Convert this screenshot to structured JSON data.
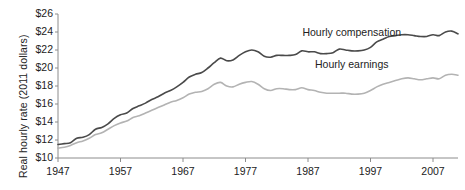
{
  "chart_data": {
    "type": "line",
    "title": "",
    "xlabel": "",
    "ylabel": "Real hourly rate (2011 dollars)",
    "xlim": [
      1947,
      2011
    ],
    "ylim": [
      10,
      26
    ],
    "ytick_prefix": "$",
    "grid": false,
    "legend": "inline-annotations",
    "xticks": [
      1947,
      1957,
      1967,
      1977,
      1987,
      1997,
      2007
    ],
    "xtick_labels": [
      "1947",
      "1957",
      "1967",
      "1977",
      "1987",
      "1997",
      "2007"
    ],
    "yticks": [
      10,
      12,
      14,
      16,
      18,
      20,
      22,
      24,
      26
    ],
    "ytick_labels": [
      "$10",
      "$12",
      "$14",
      "$16",
      "$18",
      "$20",
      "$22",
      "$24",
      "$26"
    ],
    "series": [
      {
        "name": "Hourly compensation",
        "color": "#4a4a4a",
        "label_x": 1994,
        "label_y": 23.9,
        "x": [
          1947,
          1948,
          1949,
          1950,
          1951,
          1952,
          1953,
          1954,
          1955,
          1956,
          1957,
          1958,
          1959,
          1960,
          1961,
          1962,
          1963,
          1964,
          1965,
          1966,
          1967,
          1968,
          1969,
          1970,
          1971,
          1972,
          1973,
          1974,
          1975,
          1976,
          1977,
          1978,
          1979,
          1980,
          1981,
          1982,
          1983,
          1984,
          1985,
          1986,
          1987,
          1988,
          1989,
          1990,
          1991,
          1992,
          1993,
          1994,
          1995,
          1996,
          1997,
          1998,
          1999,
          2000,
          2001,
          2002,
          2003,
          2004,
          2005,
          2006,
          2007,
          2008,
          2009,
          2010,
          2011
        ],
        "values": [
          11.5,
          11.6,
          11.7,
          12.2,
          12.3,
          12.6,
          13.2,
          13.4,
          13.8,
          14.4,
          14.8,
          15.0,
          15.5,
          15.8,
          16.1,
          16.5,
          16.8,
          17.2,
          17.5,
          17.9,
          18.4,
          19.0,
          19.3,
          19.5,
          20.0,
          20.6,
          21.1,
          20.8,
          20.9,
          21.4,
          21.8,
          22.0,
          21.8,
          21.3,
          21.2,
          21.4,
          21.4,
          21.4,
          21.5,
          21.9,
          21.8,
          21.8,
          21.6,
          21.6,
          21.7,
          22.1,
          22.0,
          21.9,
          21.9,
          22.0,
          22.3,
          22.9,
          23.2,
          23.5,
          23.6,
          23.7,
          23.7,
          23.6,
          23.5,
          23.5,
          23.7,
          23.6,
          24.0,
          24.1,
          23.8
        ]
      },
      {
        "name": "Hourly earnings",
        "color": "#b3b3b3",
        "label_x": 1994,
        "label_y": 20.3,
        "x": [
          1947,
          1948,
          1949,
          1950,
          1951,
          1952,
          1953,
          1954,
          1955,
          1956,
          1957,
          1958,
          1959,
          1960,
          1961,
          1962,
          1963,
          1964,
          1965,
          1966,
          1967,
          1968,
          1969,
          1970,
          1971,
          1972,
          1973,
          1974,
          1975,
          1976,
          1977,
          1978,
          1979,
          1980,
          1981,
          1982,
          1983,
          1984,
          1985,
          1986,
          1987,
          1988,
          1989,
          1990,
          1991,
          1992,
          1993,
          1994,
          1995,
          1996,
          1997,
          1998,
          1999,
          2000,
          2001,
          2002,
          2003,
          2004,
          2005,
          2006,
          2007,
          2008,
          2009,
          2010,
          2011
        ],
        "values": [
          11.1,
          11.2,
          11.4,
          11.7,
          11.9,
          12.2,
          12.6,
          12.8,
          13.2,
          13.6,
          13.9,
          14.1,
          14.5,
          14.7,
          15.0,
          15.3,
          15.6,
          15.9,
          16.2,
          16.4,
          16.7,
          17.1,
          17.3,
          17.4,
          17.7,
          18.2,
          18.4,
          18.0,
          17.9,
          18.2,
          18.4,
          18.5,
          18.2,
          17.7,
          17.5,
          17.7,
          17.7,
          17.6,
          17.6,
          17.8,
          17.6,
          17.5,
          17.3,
          17.2,
          17.2,
          17.2,
          17.2,
          17.1,
          17.1,
          17.2,
          17.5,
          17.9,
          18.2,
          18.4,
          18.6,
          18.8,
          18.9,
          18.8,
          18.7,
          18.8,
          18.9,
          18.8,
          19.2,
          19.3,
          19.2
        ]
      }
    ]
  }
}
